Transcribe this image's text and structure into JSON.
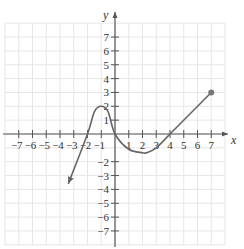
{
  "chart_data": {
    "type": "line",
    "title": "",
    "xlabel": "x",
    "ylabel": "y",
    "xlim": [
      -8,
      8
    ],
    "ylim": [
      -8,
      8
    ],
    "grid": true,
    "x_ticks": [
      -7,
      -6,
      -5,
      -4,
      -3,
      -2,
      -1,
      1,
      2,
      3,
      4,
      5,
      6,
      7
    ],
    "y_ticks": [
      7,
      6,
      5,
      4,
      3,
      2,
      1,
      -2,
      -3,
      -4,
      -5,
      -6,
      -7
    ],
    "x_tick_labels": [
      "−7",
      "−6",
      "−5",
      "−4",
      "−3",
      "−2",
      "−1",
      "1",
      "2",
      "3",
      "4",
      "5",
      "6",
      "7"
    ],
    "y_tick_labels": [
      "7",
      "6",
      "5",
      "4",
      "3",
      "2",
      "1",
      "−2",
      "−3",
      "−4",
      "−5",
      "−6",
      "−7"
    ],
    "series": [
      {
        "name": "f(x)",
        "x": [
          -3.4,
          -2.0,
          -1.5,
          -1.0,
          -0.5,
          0,
          1,
          2,
          2.3,
          3,
          4,
          7
        ],
        "y": [
          -3.6,
          0,
          1.6,
          2,
          1.6,
          0,
          -1.1,
          -1.35,
          -1.35,
          -1.0,
          0,
          3
        ],
        "left_end": "arrow",
        "right_end": "closed-dot",
        "right_endpoint": [
          7,
          3
        ]
      }
    ],
    "colors": {
      "curve": "#666666",
      "axis": "#555555",
      "grid": "#e6e6e6",
      "dot": "#777777"
    }
  }
}
